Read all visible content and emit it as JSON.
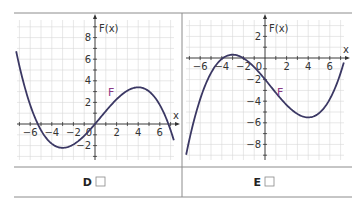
{
  "colors": {
    "curve": "#3b3864",
    "curve_label": "#8a3a86",
    "grid": "#d6d6d6",
    "axis": "#333333",
    "frame": "#8c8c8c"
  },
  "chart_data": [
    {
      "type": "line",
      "panel_label": "D",
      "checkbox": "☐",
      "xlabel": "x",
      "ylabel": "F(x)",
      "curve_label": "F",
      "xlim": [
        -7.3,
        7.3
      ],
      "ylim": [
        -3.3,
        9.6
      ],
      "x_ticks": [
        -6,
        -4,
        -2,
        2,
        4,
        6
      ],
      "y_ticks": [
        -2,
        2,
        4,
        6,
        8
      ],
      "origin_label": "0",
      "grid": true,
      "function": {
        "kind": "cubic",
        "critical_points": [
          -3,
          4
        ],
        "k": -0.098,
        "c": 0
      },
      "key_points": [
        {
          "x": -5.3,
          "y": 0
        },
        {
          "x": -3,
          "y": -2.2
        },
        {
          "x": 0,
          "y": 0
        },
        {
          "x": 4,
          "y": 3.4
        },
        {
          "x": 6.8,
          "y": 0
        },
        {
          "x": -7.3,
          "y": 6.7
        },
        {
          "x": 7.3,
          "y": -1.5
        }
      ]
    },
    {
      "type": "line",
      "panel_label": "E",
      "checkbox": "☐",
      "xlabel": "x",
      "ylabel": "F(x)",
      "curve_label": "F",
      "xlim": [
        -7.3,
        7.3
      ],
      "ylim": [
        -9.4,
        3.5
      ],
      "x_ticks": [
        -6,
        -4,
        -2,
        2,
        4,
        6
      ],
      "y_ticks": [
        -8,
        -6,
        -4,
        -2,
        2
      ],
      "origin_label": "0",
      "grid": true,
      "function": {
        "kind": "cubic",
        "critical_points": [
          -3,
          4
        ],
        "k": 0.1015,
        "c": -1.98
      },
      "key_points": [
        {
          "x": -3,
          "y": 0.3
        },
        {
          "x": 0,
          "y": -2
        },
        {
          "x": 4,
          "y": -5.5
        },
        {
          "x": -7.3,
          "y": -8.9
        },
        {
          "x": 7.3,
          "y": -0.4
        }
      ]
    }
  ]
}
